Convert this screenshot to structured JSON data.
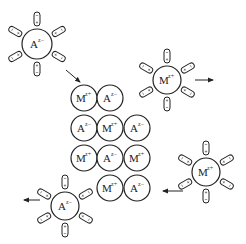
{
  "diagram": {
    "type": "ionic-crystal-dissolution",
    "colors": {
      "stroke": "#222222",
      "background": "#ffffff"
    },
    "lattice": {
      "ion_radius": 13,
      "ions": [
        {
          "species": "M",
          "charge": "z+",
          "cx": 84,
          "cy": 98
        },
        {
          "species": "A",
          "charge": "z-",
          "cx": 110,
          "cy": 98
        },
        {
          "species": "A",
          "charge": "z-",
          "cx": 84,
          "cy": 128
        },
        {
          "species": "M",
          "charge": "z+",
          "cx": 110,
          "cy": 128
        },
        {
          "species": "A",
          "charge": "z-",
          "cx": 137,
          "cy": 128
        },
        {
          "species": "M",
          "charge": "z+",
          "cx": 84,
          "cy": 158
        },
        {
          "species": "A",
          "charge": "z-",
          "cx": 110,
          "cy": 158
        },
        {
          "species": "M",
          "charge": "z+",
          "cx": 137,
          "cy": 158
        },
        {
          "species": "M",
          "charge": "z+",
          "cx": 110,
          "cy": 188
        },
        {
          "species": "A",
          "charge": "z-",
          "cx": 137,
          "cy": 188
        }
      ]
    },
    "hydrated_ions": [
      {
        "name": "hydrated-anion-top-left",
        "species": "A",
        "charge": "z-",
        "cx": 37,
        "cy": 44,
        "radius": 15,
        "arrow": {
          "x1": 66,
          "y1": 70,
          "x2": 80,
          "y2": 82,
          "direction": "toward-lattice"
        }
      },
      {
        "name": "hydrated-cation-top-right",
        "species": "M",
        "charge": "z+",
        "cx": 167,
        "cy": 80,
        "radius": 14,
        "arrow": {
          "x1": 195,
          "y1": 80,
          "x2": 213,
          "y2": 80,
          "direction": "away-right"
        }
      },
      {
        "name": "hydrated-cation-bottom-right",
        "species": "M",
        "charge": "z+",
        "cx": 206,
        "cy": 172,
        "radius": 14,
        "arrow": {
          "x1": 183,
          "y1": 191,
          "x2": 163,
          "y2": 191,
          "direction": "toward-lattice"
        }
      },
      {
        "name": "hydrated-anion-bottom-left",
        "species": "A",
        "charge": "z-",
        "cx": 65,
        "cy": 206,
        "radius": 14,
        "arrow": {
          "x1": 40,
          "y1": 200,
          "x2": 24,
          "y2": 200,
          "direction": "away-left"
        }
      }
    ],
    "labels": {
      "M": "M",
      "A": "A",
      "z_plus": "z+",
      "z_minus": "z−"
    }
  }
}
